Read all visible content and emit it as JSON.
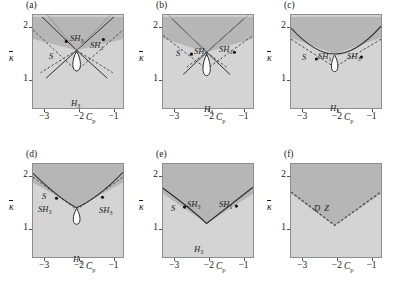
{
  "figure": {
    "axes": {
      "xlabel": "C",
      "xlabel_sub": "p",
      "ylabel": "κ",
      "xticks": [
        "−3",
        "−2",
        "−1"
      ],
      "yticks": [
        "2",
        "1"
      ],
      "xlim": [
        -3.35,
        -0.7
      ],
      "ylim": [
        0.45,
        2.25
      ]
    },
    "colors": {
      "outer_region": "#d4d4d4",
      "inner_region": "#b6b6b6",
      "loop_fill": "#ffffff",
      "solid_curve": "#2b2b2b",
      "dashed_curve": "#4a4a4a",
      "frame": "#8e8e8e",
      "background": "#ffffff"
    },
    "panels": [
      {
        "tag": "(a)",
        "labels": [
          {
            "text": "S",
            "sub": "",
            "x": 17,
            "y": 38
          },
          {
            "text": "SH",
            "sub": "3",
            "x": 38,
            "y": 20
          },
          {
            "text": "SH",
            "sub": "1",
            "x": 58,
            "y": 27
          },
          {
            "text": "H",
            "sub": "3",
            "x": 39,
            "y": 85
          }
        ],
        "has_loop": true,
        "has_inner_wedge": true,
        "has_dashed_v": true,
        "has_crossing_lines": true,
        "has_straight_rays": true,
        "dots": [
          {
            "x": 34,
            "y": 27
          },
          {
            "x": 72,
            "y": 25
          }
        ]
      },
      {
        "tag": "(b)",
        "labels": [
          {
            "text": "S",
            "sub": "",
            "x": 14,
            "y": 35
          },
          {
            "text": "SH",
            "sub": "3",
            "x": 32,
            "y": 33
          },
          {
            "text": "SH",
            "sub": "1",
            "x": 57,
            "y": 31
          },
          {
            "text": "H",
            "sub": "3",
            "x": 42,
            "y": 91
          }
        ],
        "has_loop": true,
        "has_inner_wedge": true,
        "has_dashed_v": true,
        "has_crossing_lines": true,
        "has_straight_rays": true,
        "dots": [
          {
            "x": 29,
            "y": 40
          },
          {
            "x": 73,
            "y": 38
          }
        ]
      },
      {
        "tag": "(c)",
        "labels": [
          {
            "text": "S",
            "sub": "",
            "x": 12,
            "y": 39
          },
          {
            "text": "SH",
            "sub": "1",
            "x": 28,
            "y": 38
          },
          {
            "text": "SH",
            "sub": "3",
            "x": 57,
            "y": 38
          },
          {
            "text": "H",
            "sub": "3",
            "x": 40,
            "y": 90
          }
        ],
        "has_loop": true,
        "has_inner_wedge": true,
        "has_dashed_v": true,
        "has_crossing_lines": false,
        "has_straight_rays": false,
        "dots": [
          {
            "x": 26,
            "y": 45
          },
          {
            "x": 72,
            "y": 43
          }
        ]
      },
      {
        "tag": "(d)",
        "labels": [
          {
            "text": "S",
            "sub": "",
            "x": 10,
            "y": 29
          },
          {
            "text": "SH",
            "sub": "3",
            "x": 6,
            "y": 42
          },
          {
            "text": "SH",
            "sub": "3",
            "x": 67,
            "y": 43
          },
          {
            "text": "H",
            "sub": "3",
            "x": 41,
            "y": 92
          }
        ],
        "has_loop": true,
        "has_inner_wedge": true,
        "has_dashed_v": true,
        "has_crossing_lines": false,
        "has_straight_rays": false,
        "dots": [
          {
            "x": 24,
            "y": 35
          },
          {
            "x": 71,
            "y": 34
          }
        ]
      },
      {
        "tag": "(e)",
        "labels": [
          {
            "text": "S",
            "sub": "",
            "x": 9,
            "y": 41
          },
          {
            "text": "SH",
            "sub": "3",
            "x": 25,
            "y": 37
          },
          {
            "text": "SH",
            "sub": "1",
            "x": 57,
            "y": 37
          },
          {
            "text": "H",
            "sub": "3",
            "x": 32,
            "y": 82
          }
        ],
        "has_loop": false,
        "has_inner_wedge": true,
        "has_dashed_v": false,
        "has_crossing_lines": false,
        "has_straight_rays": false,
        "dots": [
          {
            "x": 22,
            "y": 44
          },
          {
            "x": 75,
            "y": 43
          }
        ]
      },
      {
        "tag": "(f)",
        "labels": [],
        "dz_label": {
          "text": "D Z",
          "x": 24,
          "y": 40
        },
        "has_loop": false,
        "has_inner_wedge": true,
        "has_dashed_v": true,
        "has_crossing_lines": false,
        "has_straight_rays": false,
        "dots": []
      }
    ]
  }
}
